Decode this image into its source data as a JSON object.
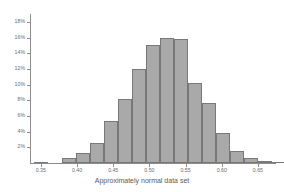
{
  "chart_data": {
    "type": "bar",
    "title": "",
    "xlabel": "Approximately normal data set",
    "ylabel": "",
    "categories": [
      "0.340",
      "0.355",
      "0.370",
      "0.385",
      "0.400",
      "0.415",
      "0.430",
      "0.445",
      "0.460",
      "0.475",
      "0.490",
      "0.505",
      "0.520",
      "0.535",
      "0.550",
      "0.565",
      "0.580",
      "0.595",
      "0.610",
      "0.625",
      "0.640",
      "0.655",
      "0.670"
    ],
    "values": [
      0.1,
      0.2,
      0.7,
      1.3,
      2.5,
      2.5,
      5.4,
      8.2,
      12.0,
      15.0,
      16.0,
      15.8,
      10.2,
      7.7,
      3.8,
      1.5,
      0.7,
      0.2,
      0.2,
      0.1,
      0.1,
      0.1,
      0.1
    ],
    "bar_lefts_px": [
      6,
      20,
      34,
      48,
      62,
      76,
      90,
      104,
      118,
      132,
      146,
      160,
      174,
      188,
      202,
      216,
      230,
      244
    ],
    "bars": [
      {
        "x": 0.345,
        "value": 0.15,
        "left_px": 4,
        "width_px": 14
      },
      {
        "x": 0.375,
        "value": 0.7,
        "left_px": 32,
        "width_px": 14
      },
      {
        "x": 0.39,
        "value": 1.3,
        "left_px": 46,
        "width_px": 14
      },
      {
        "x": 0.405,
        "value": 2.5,
        "left_px": 60,
        "width_px": 14
      },
      {
        "x": 0.42,
        "value": 5.4,
        "left_px": 74,
        "width_px": 14
      },
      {
        "x": 0.435,
        "value": 8.2,
        "left_px": 88,
        "width_px": 14
      },
      {
        "x": 0.45,
        "value": 12.0,
        "left_px": 102,
        "width_px": 14
      },
      {
        "x": 0.465,
        "value": 15.0,
        "left_px": 116,
        "width_px": 14
      },
      {
        "x": 0.48,
        "value": 16.0,
        "left_px": 130,
        "width_px": 14
      },
      {
        "x": 0.495,
        "value": 15.8,
        "left_px": 144,
        "width_px": 14
      },
      {
        "x": 0.51,
        "value": 10.2,
        "left_px": 158,
        "width_px": 14
      },
      {
        "x": 0.525,
        "value": 7.7,
        "left_px": 172,
        "width_px": 14
      },
      {
        "x": 0.54,
        "value": 3.8,
        "left_px": 186,
        "width_px": 14
      },
      {
        "x": 0.555,
        "value": 1.5,
        "left_px": 200,
        "width_px": 14
      },
      {
        "x": 0.57,
        "value": 0.7,
        "left_px": 214,
        "width_px": 14
      },
      {
        "x": 0.585,
        "value": 0.2,
        "left_px": 228,
        "width_px": 14
      },
      {
        "x": 0.6,
        "value": 0.15,
        "left_px": 242,
        "width_px": 14
      }
    ],
    "ylim": [
      0,
      19
    ],
    "ytick_values": [
      2,
      4,
      6,
      8,
      10,
      12,
      14,
      16,
      18
    ],
    "ytick_labels": [
      "2%",
      "4%",
      "6%",
      "8%",
      "10%",
      "12%",
      "14%",
      "16%",
      "18%"
    ],
    "xlim": [
      0.335,
      0.675
    ],
    "xtick_values": [
      0.35,
      0.4,
      0.45,
      0.5,
      0.55,
      0.6,
      0.65
    ],
    "xtick_labels": [
      "0.35",
      "0.40",
      "0.45",
      "0.50",
      "0.55",
      "0.60",
      "0.65"
    ],
    "grid": false,
    "legend": null,
    "bar_fill_color": "#a9a9a9",
    "bar_border_color": "#787878",
    "axis_color": "#8c8c8c",
    "background_color": "#ffffff"
  }
}
